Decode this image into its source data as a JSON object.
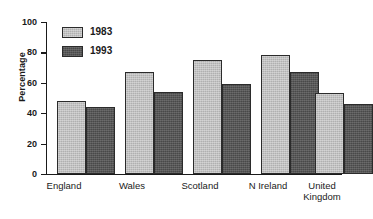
{
  "chart_data": {
    "type": "bar",
    "title": "",
    "subtitle": "",
    "xlabel": "",
    "ylabel": "Percentage",
    "ylim": [
      0,
      100
    ],
    "yticks": [
      0,
      20,
      40,
      60,
      80,
      100
    ],
    "ytick_labels": [
      "0",
      "20",
      "40",
      "60",
      "80",
      "100"
    ],
    "grid": false,
    "legend_position": "upper-left-inside",
    "categories": [
      "England",
      "Wales",
      "Scotland",
      "N Ireland",
      "United\nKingdom"
    ],
    "series": [
      {
        "name": "1983",
        "color": "#b0b0b0",
        "values": [
          48,
          67,
          75,
          78,
          53
        ]
      },
      {
        "name": "1993",
        "color": "#575757",
        "values": [
          44,
          54,
          59,
          67,
          46
        ]
      }
    ]
  },
  "axis": {
    "y_title": "Percentage",
    "tick_0": "0",
    "tick_20": "20",
    "tick_40": "40",
    "tick_60": "60",
    "tick_80": "80",
    "tick_100": "100"
  },
  "legend": {
    "items": [
      {
        "label": "1983"
      },
      {
        "label": "1993"
      }
    ]
  },
  "categories": {
    "c0": "England",
    "c1": "Wales",
    "c2": "Scotland",
    "c3": "N Ireland",
    "c4": "United\nKingdom"
  }
}
